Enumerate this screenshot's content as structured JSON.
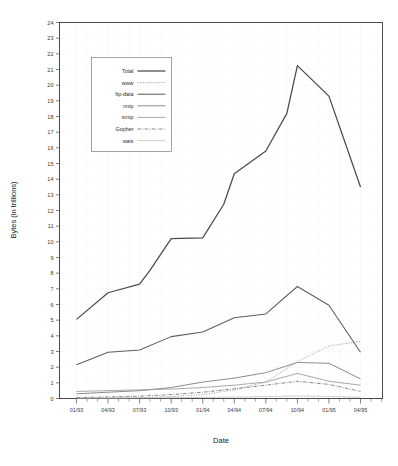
{
  "chart_data": {
    "type": "line",
    "title": "",
    "xlabel": "Date",
    "ylabel": "Bytes (in trillions)",
    "ylim": [
      0,
      24
    ],
    "ytick_step": 1,
    "grid": true,
    "legend_position": "upper-left-inside",
    "x_tick_labels": [
      "01/93",
      "04/93",
      "07/93",
      "10/93",
      "01/94",
      "04/94",
      "07/94",
      "10/94",
      "01/95",
      "04/95"
    ],
    "x_minor_ticks_per_label": 3,
    "categories": [
      "01/93",
      "02/93",
      "03/93",
      "04/93",
      "05/93",
      "06/93",
      "07/93",
      "08/93",
      "09/93",
      "10/93",
      "11/93",
      "12/93",
      "01/94",
      "02/94",
      "03/94",
      "04/94",
      "05/94",
      "06/94",
      "07/94",
      "08/94",
      "09/94",
      "10/94",
      "11/94",
      "12/94",
      "01/95",
      "02/95",
      "03/95",
      "04/95"
    ],
    "x_data_points": [
      "01/93",
      "04/93",
      "07/93",
      "08/93",
      "10/93",
      "01/94",
      "03/94",
      "04/94",
      "07/94",
      "09/94",
      "10/94",
      "01/95",
      "04/95"
    ],
    "series": [
      {
        "name": "Total",
        "style": "solid",
        "color": "#4a4a4a",
        "width": 1.25,
        "x": [
          "01/93",
          "04/93",
          "07/93",
          "08/93",
          "10/93",
          "01/94",
          "03/94",
          "04/94",
          "07/94",
          "09/94",
          "10/94",
          "01/95",
          "04/95"
        ],
        "values": [
          5.05,
          6.75,
          7.3,
          8.2,
          10.2,
          10.25,
          12.4,
          14.35,
          15.8,
          18.2,
          21.25,
          19.3,
          13.5
        ]
      },
      {
        "name": "www",
        "style": "dotted",
        "color": "#8a8a8a",
        "width": 0.85,
        "x": [
          "01/93",
          "04/93",
          "07/93",
          "10/93",
          "01/94",
          "04/94",
          "07/94",
          "10/94",
          "01/95",
          "04/95"
        ],
        "values": [
          0.02,
          0.03,
          0.05,
          0.12,
          0.25,
          0.55,
          1.05,
          2.35,
          3.35,
          3.65
        ]
      },
      {
        "name": "ftp-data",
        "style": "solid",
        "color": "#5e5e5e",
        "width": 1.05,
        "x": [
          "01/93",
          "04/93",
          "07/93",
          "10/93",
          "01/94",
          "04/94",
          "07/94",
          "10/94",
          "01/95",
          "04/95"
        ],
        "values": [
          2.15,
          2.95,
          3.1,
          3.95,
          4.25,
          5.15,
          5.4,
          7.15,
          5.95,
          2.95
        ]
      },
      {
        "name": "nntp",
        "style": "solid",
        "color": "#777777",
        "width": 0.85,
        "x": [
          "01/93",
          "04/93",
          "07/93",
          "10/93",
          "01/94",
          "04/94",
          "07/94",
          "10/94",
          "01/95",
          "04/95"
        ],
        "values": [
          0.3,
          0.4,
          0.5,
          0.7,
          1.05,
          1.3,
          1.65,
          2.3,
          2.25,
          1.25
        ]
      },
      {
        "name": "smtp",
        "style": "solid",
        "color": "#949494",
        "width": 0.8,
        "x": [
          "01/93",
          "04/93",
          "07/93",
          "10/93",
          "01/94",
          "04/94",
          "07/94",
          "10/94",
          "01/95",
          "04/95"
        ],
        "values": [
          0.45,
          0.5,
          0.55,
          0.6,
          0.7,
          0.85,
          1.05,
          1.6,
          1.1,
          0.85
        ]
      },
      {
        "name": "Gopher",
        "style": "dashdot",
        "color": "#6e6e6e",
        "width": 0.85,
        "x": [
          "01/93",
          "04/93",
          "07/93",
          "10/93",
          "01/94",
          "04/94",
          "07/94",
          "10/94",
          "01/95",
          "04/95"
        ],
        "values": [
          0.06,
          0.1,
          0.15,
          0.25,
          0.4,
          0.62,
          0.85,
          1.1,
          0.9,
          0.45
        ]
      },
      {
        "name": "wais",
        "style": "solid",
        "color": "#b8b8b8",
        "width": 0.7,
        "x": [
          "01/93",
          "04/93",
          "07/93",
          "10/93",
          "01/94",
          "04/94",
          "07/94",
          "10/94",
          "01/95",
          "04/95"
        ],
        "values": [
          0.02,
          0.03,
          0.04,
          0.05,
          0.07,
          0.09,
          0.12,
          0.16,
          0.13,
          0.08
        ]
      }
    ],
    "y_tick_labels": [
      "0",
      "1",
      "2",
      "3",
      "4",
      "5",
      "6",
      "7",
      "8",
      "9",
      "10",
      "11",
      "12",
      "13",
      "14",
      "15",
      "16",
      "17",
      "18",
      "19",
      "20",
      "21",
      "22",
      "23",
      "24"
    ]
  },
  "legend": {
    "entries": [
      {
        "label": "Total"
      },
      {
        "label": "www"
      },
      {
        "label": "ftp-data"
      },
      {
        "label": "nntp"
      },
      {
        "label": "smtp"
      },
      {
        "label": "Gopher"
      },
      {
        "label": "wais"
      }
    ]
  }
}
